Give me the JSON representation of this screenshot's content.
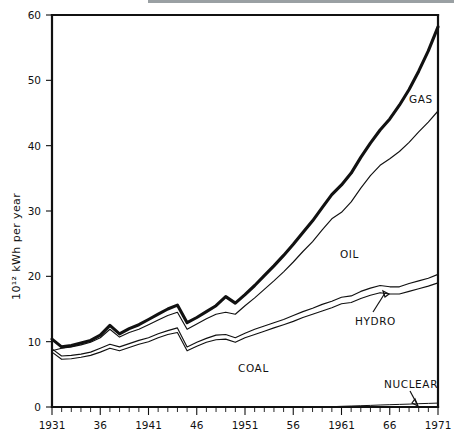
{
  "figure": {
    "title": "",
    "background_color": "#ffffff",
    "ink_color": "#111111",
    "top_rule_color": "#9aa0a3"
  },
  "axes": {
    "y_axis_label": "10¹² kWh per year",
    "y_ticks": [
      "0",
      "10",
      "20",
      "30",
      "40",
      "50",
      "60"
    ],
    "x_ticks": [
      "1931",
      "36",
      "1941",
      "46",
      "1951",
      "56",
      "1961",
      "66",
      "1971"
    ]
  },
  "series_labels": {
    "coal": "COAL",
    "hydro": "HYDRO",
    "oil": "OIL",
    "gas": "GAS",
    "nuclear": "NUCLEAR"
  },
  "chart_data": {
    "type": "area",
    "title": "",
    "xlabel": "",
    "ylabel": "10¹² kWh per year",
    "xlim": [
      1931,
      1971
    ],
    "ylim": [
      0,
      60
    ],
    "grid": false,
    "legend": "inline-annotations",
    "stacked": true,
    "stack_order": [
      "nuclear",
      "coal",
      "hydro",
      "oil",
      "gas"
    ],
    "x": [
      1931,
      1932,
      1933,
      1934,
      1935,
      1936,
      1937,
      1938,
      1939,
      1940,
      1941,
      1942,
      1943,
      1944,
      1945,
      1946,
      1947,
      1948,
      1949,
      1950,
      1951,
      1952,
      1953,
      1954,
      1955,
      1956,
      1957,
      1958,
      1959,
      1960,
      1961,
      1962,
      1963,
      1964,
      1965,
      1966,
      1967,
      1968,
      1969,
      1970,
      1971
    ],
    "series": [
      {
        "name": "NUCLEAR",
        "values": [
          0,
          0,
          0,
          0,
          0,
          0,
          0,
          0,
          0,
          0,
          0,
          0,
          0,
          0,
          0,
          0,
          0,
          0,
          0,
          0,
          0,
          0,
          0,
          0,
          0,
          0,
          0,
          0,
          0,
          0.05,
          0.1,
          0.15,
          0.2,
          0.25,
          0.3,
          0.35,
          0.4,
          0.45,
          0.5,
          0.55,
          0.6
        ]
      },
      {
        "name": "COAL",
        "values": [
          8.4,
          7.3,
          7.4,
          7.6,
          7.9,
          8.4,
          9.0,
          8.6,
          9.1,
          9.6,
          10.0,
          10.6,
          11.1,
          11.4,
          8.6,
          9.3,
          9.9,
          10.3,
          10.4,
          9.9,
          10.6,
          11.1,
          11.6,
          12.1,
          12.6,
          13.1,
          13.7,
          14.2,
          14.7,
          15.2,
          15.8,
          16.0,
          16.5,
          17.0,
          17.4,
          17.2,
          17.2,
          17.6,
          18.0,
          18.4,
          18.8
        ]
      },
      {
        "name": "HYDRO",
        "values": [
          0.5,
          0.5,
          0.5,
          0.5,
          0.5,
          0.6,
          0.6,
          0.6,
          0.6,
          0.6,
          0.6,
          0.6,
          0.6,
          0.7,
          0.6,
          0.6,
          0.6,
          0.7,
          0.7,
          0.7,
          0.7,
          0.8,
          0.8,
          0.8,
          0.8,
          0.9,
          0.9,
          0.9,
          1.0,
          1.0,
          1.0,
          1.0,
          1.1,
          1.1,
          1.1,
          1.1,
          1.1,
          1.2,
          1.2,
          1.2,
          1.3
        ]
      },
      {
        "name": "OIL",
        "values": [
          1.6,
          1.5,
          1.6,
          1.7,
          1.9,
          2.1,
          2.5,
          2.2,
          2.5,
          2.6,
          2.7,
          2.9,
          3.0,
          3.1,
          2.5,
          2.8,
          3.0,
          3.2,
          3.4,
          3.6,
          4.2,
          4.8,
          5.6,
          6.4,
          7.3,
          8.2,
          9.2,
          10.2,
          11.4,
          12.6,
          13.0,
          14.4,
          15.8,
          17.2,
          18.4,
          19.6,
          20.7,
          21.6,
          22.8,
          23.9,
          25.0
        ]
      },
      {
        "name": "GAS",
        "values": [
          0.4,
          0.4,
          0.4,
          0.5,
          0.5,
          0.6,
          0.8,
          0.6,
          0.7,
          0.8,
          0.9,
          1.0,
          1.1,
          1.2,
          1.0,
          1.1,
          1.2,
          1.4,
          1.6,
          1.6,
          1.8,
          2.0,
          2.2,
          2.4,
          2.6,
          2.8,
          3.0,
          3.3,
          3.6,
          3.9,
          4.3,
          4.5,
          4.8,
          5.2,
          5.6,
          6.3,
          7.3,
          8.4,
          9.8,
          11.2,
          12.9
        ]
      }
    ],
    "cumulative_top_lines": {
      "note": "Upper boundary of each stacked band (values in 10^12 kWh per year)",
      "coal_top": [
        8.4,
        7.3,
        7.4,
        7.6,
        7.9,
        8.4,
        9.0,
        8.6,
        9.1,
        9.6,
        10.0,
        10.6,
        11.1,
        11.4,
        8.6,
        9.3,
        9.9,
        10.3,
        10.4,
        9.9,
        10.6,
        11.1,
        11.6,
        12.1,
        12.6,
        13.1,
        13.7,
        14.2,
        14.7,
        15.2,
        15.8,
        16.0,
        16.6,
        17.1,
        17.5,
        17.3,
        17.3,
        17.7,
        18.1,
        18.5,
        19.0
      ],
      "hydro_top": [
        8.9,
        7.8,
        7.9,
        8.1,
        8.4,
        9.0,
        9.6,
        9.2,
        9.7,
        10.2,
        10.6,
        11.2,
        11.7,
        12.1,
        9.2,
        9.9,
        10.5,
        11.0,
        11.1,
        10.6,
        11.3,
        11.9,
        12.4,
        12.9,
        13.4,
        14.0,
        14.6,
        15.1,
        15.7,
        16.2,
        16.8,
        17.0,
        17.7,
        18.2,
        18.6,
        18.4,
        18.4,
        18.9,
        19.3,
        19.7,
        20.3
      ],
      "oil_top": [
        8.6,
        9.0,
        9.2,
        9.5,
        9.9,
        10.6,
        11.9,
        10.7,
        11.4,
        11.9,
        12.6,
        13.3,
        14.0,
        14.5,
        11.9,
        12.7,
        13.5,
        14.2,
        14.5,
        14.2,
        15.5,
        16.7,
        18.0,
        19.3,
        20.7,
        22.2,
        23.8,
        25.3,
        27.1,
        28.8,
        29.8,
        31.4,
        33.5,
        35.4,
        37.0,
        38.0,
        39.1,
        40.5,
        42.1,
        43.6,
        45.3
      ],
      "gas_top": [
        10.4,
        9.2,
        9.4,
        9.8,
        10.2,
        11.0,
        12.5,
        11.2,
        12.0,
        12.6,
        13.4,
        14.2,
        15.0,
        15.6,
        12.9,
        13.7,
        14.6,
        15.5,
        16.9,
        15.9,
        17.2,
        18.6,
        20.1,
        21.6,
        23.2,
        24.9,
        26.7,
        28.5,
        30.5,
        32.5,
        34.0,
        35.8,
        38.2,
        40.4,
        42.4,
        44.1,
        46.2,
        48.6,
        51.4,
        54.5,
        58.2
      ]
    }
  }
}
